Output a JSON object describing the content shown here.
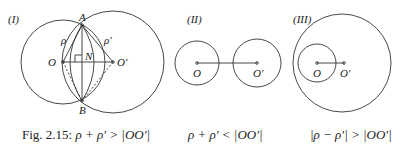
{
  "figure": {
    "panels": [
      {
        "id": "I",
        "label": "(I)",
        "points": {
          "O": "O",
          "O_prime": "O′",
          "A": "A",
          "B": "B",
          "N": "N"
        },
        "radii": {
          "rho": "ρ",
          "rho_prime": "ρ′"
        }
      },
      {
        "id": "II",
        "label": "(II)",
        "points": {
          "O": "O",
          "O_prime": "O′"
        }
      },
      {
        "id": "III",
        "label": "(III)",
        "points": {
          "O": "O",
          "O_prime": "O′"
        }
      }
    ],
    "captions": [
      {
        "prefix": "Fig. 2.15: ",
        "formula": "ρ + ρ′ > |OO′|"
      },
      {
        "prefix": "",
        "formula": "ρ + ρ′ < |OO′|"
      },
      {
        "prefix": "",
        "formula": "|ρ − ρ′| > |OO′|"
      }
    ],
    "colors": {
      "stroke": "#333333",
      "text": "#222222"
    }
  }
}
